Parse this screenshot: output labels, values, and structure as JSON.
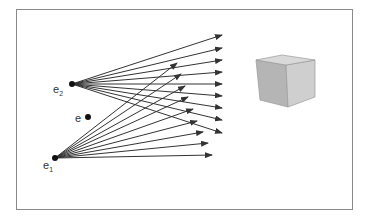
{
  "diagram": {
    "frame_color": "#8a8a8a",
    "ray_color": "#333333",
    "points": [
      {
        "id": "e2",
        "label": "e",
        "subscript": "2",
        "x": 72,
        "y": 84
      },
      {
        "id": "e",
        "label": "e",
        "subscript": "",
        "x": 88,
        "y": 117
      },
      {
        "id": "e1",
        "label": "e",
        "subscript": "1",
        "x": 55,
        "y": 158
      }
    ],
    "rays_e2": [
      [
        222,
        35
      ],
      [
        222,
        48
      ],
      [
        222,
        60
      ],
      [
        222,
        72
      ],
      [
        222,
        84
      ],
      [
        222,
        96
      ],
      [
        222,
        108
      ],
      [
        222,
        120
      ],
      [
        222,
        133
      ]
    ],
    "rays_e1": [
      [
        177,
        63
      ],
      [
        181,
        74
      ],
      [
        185,
        86
      ],
      [
        188,
        97
      ],
      [
        193,
        109
      ],
      [
        197,
        121
      ],
      [
        203,
        132
      ],
      [
        208,
        143
      ],
      [
        212,
        155
      ]
    ],
    "cube": {
      "top": [
        [
          256,
          60
        ],
        [
          282,
          55
        ],
        [
          315,
          60
        ],
        [
          286,
          65
        ]
      ],
      "left": [
        [
          256,
          60
        ],
        [
          286,
          65
        ],
        [
          288,
          107
        ],
        [
          260,
          100
        ]
      ],
      "right": [
        [
          286,
          65
        ],
        [
          315,
          60
        ],
        [
          315,
          97
        ],
        [
          288,
          107
        ]
      ],
      "colors": {
        "top": "#d9d9d9",
        "left": "#b5b5b5",
        "right": "#cfcfcf",
        "edge": "#9a9a9a"
      }
    }
  }
}
